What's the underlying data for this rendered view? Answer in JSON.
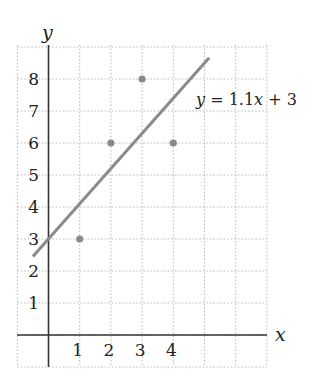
{
  "chart_data": {
    "type": "scatter",
    "title": "",
    "xlabel": "x",
    "ylabel": "y",
    "xlim": [
      -1,
      7
    ],
    "ylim": [
      -1,
      9
    ],
    "grid": true,
    "grid_style": "dotted",
    "x_ticks": [
      1,
      2,
      3,
      4
    ],
    "y_ticks": [
      1,
      2,
      3,
      4,
      5,
      6,
      7,
      8
    ],
    "series": [
      {
        "name": "data points",
        "type": "scatter",
        "color": "#8a8a8a",
        "points": [
          {
            "x": 1,
            "y": 3
          },
          {
            "x": 2,
            "y": 6
          },
          {
            "x": 3,
            "y": 8
          },
          {
            "x": 4,
            "y": 6
          }
        ]
      },
      {
        "name": "regression line",
        "type": "line",
        "color": "#8a8a8a",
        "slope": 1.1,
        "intercept": 3,
        "x_range": [
          -0.5,
          5.15
        ]
      }
    ],
    "annotations": [
      {
        "text": "y = 1.1x + 3",
        "x": 5,
        "y": 7.4
      }
    ],
    "legend": null
  },
  "labels": {
    "x_axis": "x",
    "y_axis": "y",
    "equation": {
      "lhs": "y",
      "eq": " = 1.1",
      "var": "x",
      "rest": " + 3"
    }
  }
}
